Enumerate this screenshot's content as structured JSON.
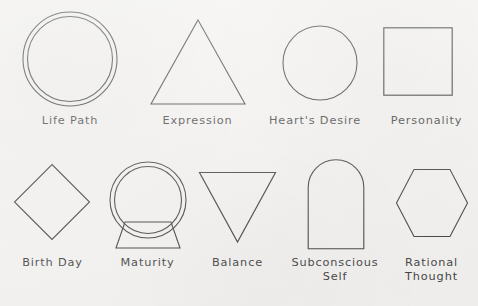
{
  "diagram": {
    "background_color": "#f2f1ef",
    "stroke_color": "#3a3a3a",
    "text_color": "#3c3c3c",
    "rows": [
      {
        "row_index": 1,
        "items": [
          {
            "label": "Life Path",
            "shape": "double-circle",
            "shape_name": "double-circle-shape"
          },
          {
            "label": "Expression",
            "shape": "triangle-up",
            "shape_name": "triangle-up-shape"
          },
          {
            "label": "Heart's Desire",
            "shape": "circle",
            "shape_name": "circle-shape"
          },
          {
            "label": "Personality",
            "shape": "square",
            "shape_name": "square-shape"
          }
        ]
      },
      {
        "row_index": 2,
        "items": [
          {
            "label": "Birth Day",
            "shape": "diamond",
            "shape_name": "diamond-shape"
          },
          {
            "label": "Maturity",
            "shape": "double-circle-on-trapezoid",
            "shape_name": "double-circle-on-trapezoid-shape"
          },
          {
            "label": "Balance",
            "shape": "triangle-down",
            "shape_name": "triangle-down-shape"
          },
          {
            "label": "Subconscious\nSelf",
            "shape": "arch",
            "shape_name": "arch-shape"
          },
          {
            "label": "Rational\nThought",
            "shape": "hexagon",
            "shape_name": "hexagon-shape"
          }
        ]
      }
    ]
  }
}
